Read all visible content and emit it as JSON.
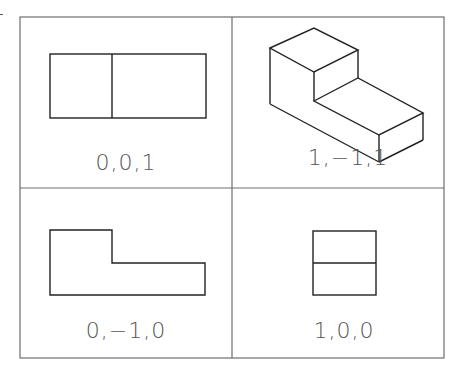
{
  "colors": {
    "line": "#222222",
    "grid": "#6e6e6e",
    "text": "#555555",
    "background": "#ffffff"
  },
  "panels": [
    {
      "id": "top-left",
      "viewpoint": "0,0,1",
      "view": "top view"
    },
    {
      "id": "top-right",
      "viewpoint": "1,−1,1",
      "view": "isometric view"
    },
    {
      "id": "bottom-left",
      "viewpoint": "0,−1,0",
      "view": "front view"
    },
    {
      "id": "bottom-right",
      "viewpoint": "1,0,0",
      "view": "side view"
    }
  ]
}
